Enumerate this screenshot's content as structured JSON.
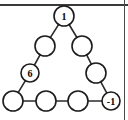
{
  "figure": {
    "colors": {
      "node_fill": "#ffffff",
      "node_stroke": "#1c1c1c",
      "edge_stroke": "#2b2b2b",
      "label_color": "#000000",
      "rule_color": "#3a3a3a",
      "background": "#ffffff"
    },
    "rules": {
      "top_rule": "horizontal-rule",
      "right_rule": "vertical-rule"
    },
    "geometry": {
      "node_radius": 10,
      "small_node_radius": 9
    },
    "nodes": [
      {
        "id": "apex",
        "label": "1",
        "cx": 64,
        "cy": 16,
        "r": 10,
        "labeled": true
      },
      {
        "id": "left-upper",
        "label": "",
        "cx": 45,
        "cy": 46,
        "r": 10,
        "labeled": false
      },
      {
        "id": "right-upper",
        "label": "",
        "cx": 82,
        "cy": 46,
        "r": 10,
        "labeled": false
      },
      {
        "id": "left-lower",
        "label": "6",
        "cx": 30,
        "cy": 73,
        "r": 9,
        "labeled": true
      },
      {
        "id": "right-lower",
        "label": "",
        "cx": 96,
        "cy": 73,
        "r": 10,
        "labeled": false
      },
      {
        "id": "bottom-1",
        "label": "",
        "cx": 13,
        "cy": 101,
        "r": 10,
        "labeled": false
      },
      {
        "id": "bottom-2",
        "label": "",
        "cx": 46,
        "cy": 101,
        "r": 10,
        "labeled": false
      },
      {
        "id": "bottom-3",
        "label": "",
        "cx": 78,
        "cy": 101,
        "r": 10,
        "labeled": false
      },
      {
        "id": "bottom-4",
        "label": "-1",
        "cx": 111,
        "cy": 101,
        "r": 9,
        "labeled": true
      }
    ],
    "edges": [
      {
        "from": "apex",
        "to": "left-upper"
      },
      {
        "from": "apex",
        "to": "right-upper"
      },
      {
        "from": "left-upper",
        "to": "left-lower"
      },
      {
        "from": "right-upper",
        "to": "right-lower"
      },
      {
        "from": "left-lower",
        "to": "bottom-1"
      },
      {
        "from": "right-lower",
        "to": "bottom-4"
      },
      {
        "from": "bottom-1",
        "to": "bottom-2"
      },
      {
        "from": "bottom-2",
        "to": "bottom-3"
      },
      {
        "from": "bottom-3",
        "to": "bottom-4"
      }
    ]
  }
}
